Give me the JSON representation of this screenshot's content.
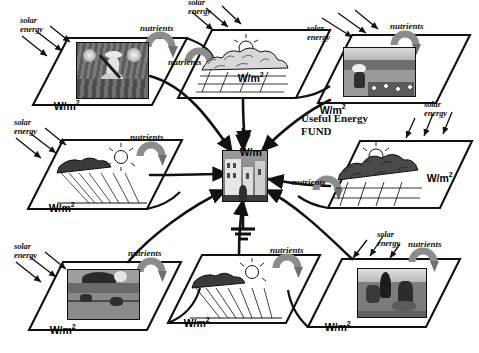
{
  "diagram": {
    "labels": {
      "solar_energy": "solar\nenergy",
      "nutrients": "nutrients",
      "wm2": "W/m",
      "wm2_sup": "2",
      "useful_energy_fund": "Useful Energy\nFUND"
    },
    "colors": {
      "ink": "#111111",
      "background": "#ffffff",
      "arc_arrow": "#8c8c8c",
      "arc_arrow_dark": "#6f6f6f",
      "photo_frame": "#111111"
    },
    "panels": [
      {
        "id": "top-left",
        "name": "farmer-digging-panel",
        "wm2": "W/m2",
        "solar_energy": true,
        "nutrients": true,
        "art": "van-gogh-digger"
      },
      {
        "id": "top-center",
        "name": "forest-field-panel",
        "wm2": "W/m2",
        "solar_energy": true,
        "nutrients": true,
        "art": "forest-fields-linework"
      },
      {
        "id": "top-right",
        "name": "flower-field-panel",
        "wm2": "W/m2",
        "solar_energy": true,
        "nutrients": true,
        "art": "figure-flower-field"
      },
      {
        "id": "mid-left",
        "name": "plowed-field-panel",
        "wm2": "W/m2",
        "solar_energy": true,
        "nutrients": true,
        "art": "sun-plowed-field-linework"
      },
      {
        "id": "mid-right",
        "name": "mountain-forest-panel",
        "wm2": "W/m2",
        "solar_energy": true,
        "nutrients": true,
        "art": "mountain-forest-linework"
      },
      {
        "id": "bottom-left",
        "name": "harvest-landscape-panel",
        "wm2": "W/m2",
        "solar_energy": true,
        "nutrients": true,
        "art": "hill-workers-landscape"
      },
      {
        "id": "bottom-center",
        "name": "furrowed-field-panel",
        "wm2": "W/m2",
        "solar_energy": false,
        "nutrients": true,
        "art": "sun-furrows-linework"
      },
      {
        "id": "bottom-right",
        "name": "herder-animals-panel",
        "wm2": "W/m2",
        "solar_energy": true,
        "nutrients": true,
        "art": "herder-with-animals"
      }
    ],
    "center": {
      "name": "urban-center-node",
      "wm2": "W/m2",
      "art": "city-buildings",
      "ground_symbol": "earth-ground"
    },
    "legend_text": "Useful Energy FUND",
    "flow_count": 8,
    "solar_arrow_groups": 7,
    "nutrient_arcs": 8
  }
}
